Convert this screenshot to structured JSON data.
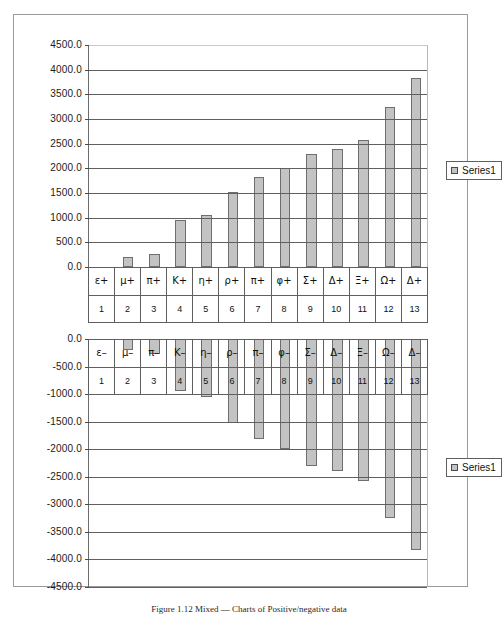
{
  "figure": {
    "caption": "Figure 1.12 Mixed — Charts of Positive/negative data"
  },
  "charts": [
    {
      "id": "top",
      "legend_label": "Series1",
      "y_ticks": [
        "4500.0",
        "4000.0",
        "3500.0",
        "3000.0",
        "2500.0",
        "2000.0",
        "1500.0",
        "1000.0",
        "500.0",
        "0.0"
      ]
    },
    {
      "id": "bottom",
      "legend_label": "Series1",
      "y_ticks": [
        "0.0",
        "-500.0",
        "-1000.0",
        "-1500.0",
        "-2000.0",
        "-2500.0",
        "-3000.0",
        "-3500.0",
        "-4000.0",
        "-4500.0"
      ]
    }
  ],
  "chart_data": [
    {
      "type": "bar",
      "title": "",
      "xlabel": "",
      "ylabel": "",
      "ylim": [
        0,
        4500
      ],
      "ytick_step": 500,
      "grid": true,
      "legend": [
        "Series1"
      ],
      "legend_position": "right",
      "categories": [
        "ε+",
        "μ+",
        "π+",
        "K+",
        "η+",
        "ρ+",
        "π+",
        "φ+",
        "Σ+",
        "Δ+",
        "Ξ+",
        "Ω+",
        "Δ+"
      ],
      "category_indices": [
        "1",
        "2",
        "3",
        "4",
        "5",
        "6",
        "7",
        "8",
        "9",
        "10",
        "11",
        "12",
        "13"
      ],
      "series": [
        {
          "name": "Series1",
          "values": [
            0,
            200,
            270,
            950,
            1060,
            1520,
            1820,
            2000,
            2300,
            2390,
            2570,
            3250,
            3830
          ]
        }
      ]
    },
    {
      "type": "bar",
      "title": "",
      "xlabel": "",
      "ylabel": "",
      "ylim": [
        -4500,
        0
      ],
      "ytick_step": 500,
      "grid": true,
      "legend": [
        "Series1"
      ],
      "legend_position": "right",
      "categories": [
        "ε–",
        "μ–",
        "π–",
        "K–",
        "η–",
        "ρ–",
        "π–",
        "φ–",
        "Σ–",
        "Δ–",
        "Ξ–",
        "Ω–",
        "Δ–"
      ],
      "category_indices": [
        "1",
        "2",
        "3",
        "4",
        "5",
        "6",
        "7",
        "8",
        "9",
        "10",
        "11",
        "12",
        "13"
      ],
      "series": [
        {
          "name": "Series1",
          "values": [
            0,
            -200,
            -270,
            -950,
            -1060,
            -1520,
            -1820,
            -2000,
            -2300,
            -2390,
            -2570,
            -3250,
            -3830
          ]
        }
      ]
    }
  ]
}
